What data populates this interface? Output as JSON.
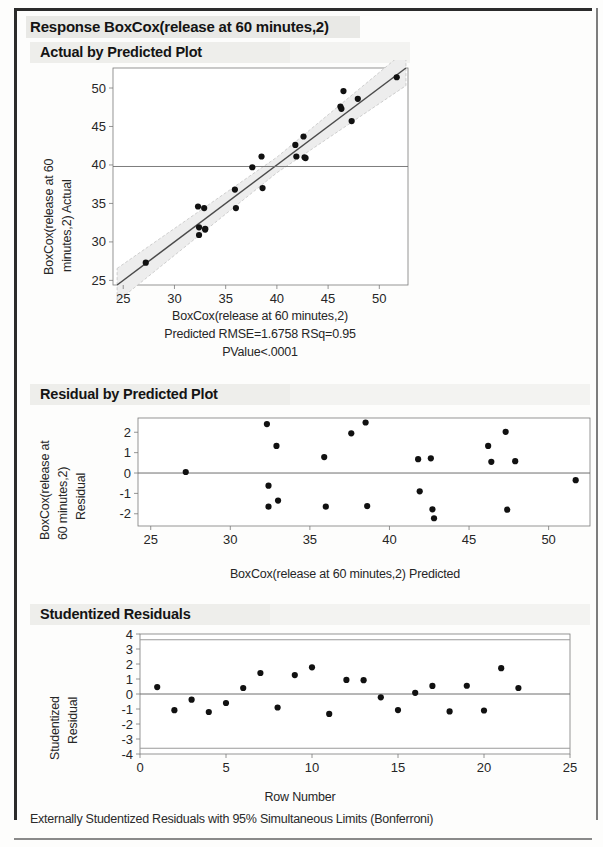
{
  "report": {
    "response_title": "Response BoxCox(release at 60 minutes,2)",
    "footer_note": "Externally Studentized Residuals with 95% Simultaneous Limits (Bonferroni)"
  },
  "sections": {
    "actual_by_predicted": {
      "header": "Actual by Predicted Plot",
      "caption_line1": "BoxCox(release at 60 minutes,2)",
      "caption_line2": "Predicted RMSE=1.6758 RSq=0.95",
      "caption_line3": "PValue<.0001"
    },
    "residual_by_predicted": {
      "header": "Residual by Predicted Plot"
    },
    "studentized_residuals": {
      "header": "Studentized Residuals"
    }
  },
  "colors": {
    "marker": "#111111",
    "fit_line": "#4a4a4a",
    "ci_band": "#bdbdbd",
    "axis": "#7a7a7a",
    "mean_line": "#6e6e6e",
    "header_band": "#eeeeeb",
    "text": "#1a1a1a"
  },
  "chart_data": [
    {
      "type": "scatter",
      "name": "Actual by Predicted Plot",
      "title": "Actual by Predicted Plot",
      "xlabel": "BoxCox(release at 60 minutes,2) Predicted",
      "ylabel": "BoxCox(release at 60 minutes,2) Actual",
      "xlim": [
        24.0,
        52.8
      ],
      "ylim": [
        24.4,
        52.6
      ],
      "xticks": [
        25,
        30,
        35,
        40,
        45,
        50
      ],
      "yticks": [
        25,
        30,
        35,
        40,
        45,
        50
      ],
      "grid": false,
      "annotations": {
        "rmse": 1.6758,
        "rsq": 0.95,
        "pvalue": "<.0001",
        "mean_line_y": 39.8
      },
      "fit_line": {
        "type": "identity",
        "from": [
          24.4,
          24.4
        ],
        "to": [
          52.6,
          52.6
        ]
      },
      "ci_band": true,
      "points": [
        {
          "x": 27.2,
          "y": 27.3
        },
        {
          "x": 32.3,
          "y": 34.6
        },
        {
          "x": 32.4,
          "y": 31.9
        },
        {
          "x": 32.4,
          "y": 30.9
        },
        {
          "x": 32.9,
          "y": 34.4
        },
        {
          "x": 33.0,
          "y": 31.7
        },
        {
          "x": 33.0,
          "y": 31.6
        },
        {
          "x": 35.9,
          "y": 36.8
        },
        {
          "x": 36.0,
          "y": 34.4
        },
        {
          "x": 37.6,
          "y": 39.7
        },
        {
          "x": 38.5,
          "y": 41.1
        },
        {
          "x": 38.6,
          "y": 37.0
        },
        {
          "x": 41.8,
          "y": 42.6
        },
        {
          "x": 41.9,
          "y": 41.1
        },
        {
          "x": 42.6,
          "y": 43.7
        },
        {
          "x": 42.7,
          "y": 41.0
        },
        {
          "x": 42.8,
          "y": 40.9
        },
        {
          "x": 46.2,
          "y": 47.6
        },
        {
          "x": 46.3,
          "y": 47.3
        },
        {
          "x": 46.5,
          "y": 49.6
        },
        {
          "x": 47.3,
          "y": 45.7
        },
        {
          "x": 47.9,
          "y": 48.6
        },
        {
          "x": 51.7,
          "y": 51.4
        }
      ]
    },
    {
      "type": "scatter",
      "name": "Residual by Predicted Plot",
      "title": "Residual by Predicted Plot",
      "xlabel": "BoxCox(release at 60 minutes,2) Predicted",
      "ylabel": "BoxCox(release at 60 minutes,2) Residual",
      "xlim": [
        24.2,
        52.6
      ],
      "ylim": [
        -2.6,
        2.7
      ],
      "xticks": [
        25,
        30,
        35,
        40,
        45,
        50
      ],
      "yticks": [
        -2,
        -1,
        0,
        1,
        2
      ],
      "grid": false,
      "zero_line": 0,
      "points": [
        {
          "x": 27.2,
          "y": 0.05
        },
        {
          "x": 32.3,
          "y": 2.4
        },
        {
          "x": 32.4,
          "y": -0.62
        },
        {
          "x": 32.4,
          "y": -1.65
        },
        {
          "x": 32.9,
          "y": 1.33
        },
        {
          "x": 33.0,
          "y": -1.35
        },
        {
          "x": 35.9,
          "y": 0.78
        },
        {
          "x": 36.0,
          "y": -1.65
        },
        {
          "x": 37.6,
          "y": 1.95
        },
        {
          "x": 38.5,
          "y": 2.48
        },
        {
          "x": 38.6,
          "y": -1.62
        },
        {
          "x": 41.8,
          "y": 0.68
        },
        {
          "x": 41.9,
          "y": -0.9
        },
        {
          "x": 42.6,
          "y": 0.72
        },
        {
          "x": 42.7,
          "y": -1.78
        },
        {
          "x": 42.8,
          "y": -2.22
        },
        {
          "x": 46.2,
          "y": 1.33
        },
        {
          "x": 46.4,
          "y": 0.55
        },
        {
          "x": 47.3,
          "y": 2.02
        },
        {
          "x": 47.4,
          "y": -1.8
        },
        {
          "x": 47.9,
          "y": 0.58
        },
        {
          "x": 51.7,
          "y": -0.35
        }
      ]
    },
    {
      "type": "scatter",
      "name": "Studentized Residuals",
      "title": "Studentized Residuals",
      "xlabel": "Row Number",
      "ylabel": "Studentized Residual",
      "xlim": [
        0,
        25
      ],
      "ylim": [
        -4,
        4
      ],
      "xticks": [
        0,
        5,
        10,
        15,
        20,
        25
      ],
      "yticks": [
        -4,
        -3,
        -2,
        -1,
        0,
        1,
        2,
        3,
        4
      ],
      "grid": false,
      "zero_line": 0,
      "limit_lines": [
        3.62,
        -3.62
      ],
      "limit_label": "95% Simultaneous Limits (Bonferroni)",
      "points": [
        {
          "x": 1,
          "y": 0.46
        },
        {
          "x": 2,
          "y": -1.08
        },
        {
          "x": 3,
          "y": -0.38
        },
        {
          "x": 4,
          "y": -1.2
        },
        {
          "x": 5,
          "y": -0.6
        },
        {
          "x": 6,
          "y": 0.4
        },
        {
          "x": 7,
          "y": 1.4
        },
        {
          "x": 8,
          "y": -0.9
        },
        {
          "x": 9,
          "y": 1.26
        },
        {
          "x": 10,
          "y": 1.78
        },
        {
          "x": 11,
          "y": -1.33
        },
        {
          "x": 12,
          "y": 0.94
        },
        {
          "x": 13,
          "y": 0.92
        },
        {
          "x": 14,
          "y": -0.22
        },
        {
          "x": 15,
          "y": -1.07
        },
        {
          "x": 16,
          "y": 0.08
        },
        {
          "x": 17,
          "y": 0.54
        },
        {
          "x": 18,
          "y": -1.16
        },
        {
          "x": 19,
          "y": 0.55
        },
        {
          "x": 20,
          "y": -1.1
        },
        {
          "x": 21,
          "y": 1.72
        },
        {
          "x": 22,
          "y": 0.4
        }
      ]
    }
  ]
}
